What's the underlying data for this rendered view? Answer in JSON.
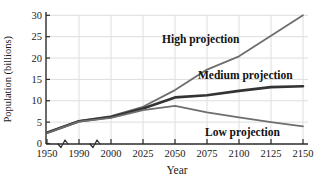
{
  "chart_data": {
    "type": "line",
    "title": "",
    "xlabel": "Year",
    "ylabel": "Population (billions)",
    "categories": [
      "1950",
      "1990",
      "2000",
      "2025",
      "2050",
      "2075",
      "2100",
      "2125",
      "2150"
    ],
    "y_ticks": [
      0,
      5,
      10,
      15,
      20,
      25,
      30
    ],
    "ylim": [
      0,
      30
    ],
    "grid": true,
    "legend_position": "inline-annotations",
    "axis_breaks": [
      "x-axis break between 1950 and 1990",
      "x-axis break between 1990 and 2000"
    ],
    "series": [
      {
        "name": "High projection",
        "color": "#6e6e6e",
        "width": 1.8,
        "values": [
          2.6,
          5.3,
          6.4,
          8.6,
          12.5,
          17.3,
          20.4,
          25.2,
          30.0
        ]
      },
      {
        "name": "Medium projection",
        "color": "#333333",
        "width": 2.6,
        "values": [
          2.5,
          5.2,
          6.2,
          8.2,
          10.8,
          11.3,
          12.3,
          13.2,
          13.4
        ]
      },
      {
        "name": "Low projection",
        "color": "#6e6e6e",
        "width": 1.8,
        "values": [
          2.45,
          5.1,
          6.0,
          7.8,
          8.8,
          7.3,
          6.1,
          5.0,
          4.0
        ]
      }
    ],
    "colors": {
      "axis": "#2b2b2b",
      "grid": "#dedede",
      "text": "#1a1a1a"
    }
  }
}
